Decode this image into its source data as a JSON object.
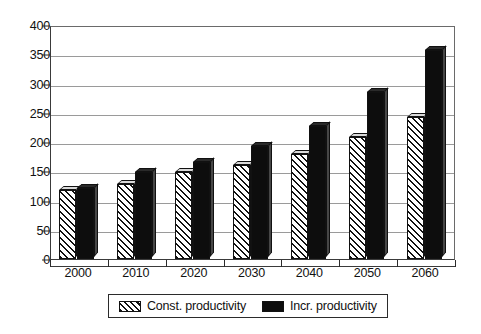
{
  "chart_data": {
    "type": "bar",
    "title": "",
    "subtitle": "",
    "xlabel": "",
    "ylabel": "",
    "categories": [
      "2000",
      "2010",
      "2020",
      "2030",
      "2040",
      "2050",
      "2060"
    ],
    "series": [
      {
        "name": "Const. productivity",
        "style": "hatched",
        "color": "#f2f2f2",
        "values": [
          118,
          128,
          148,
          161,
          180,
          208,
          243
        ]
      },
      {
        "name": "Incr. productivity",
        "style": "solid",
        "color": "#0d0d0d",
        "values": [
          122,
          148,
          166,
          193,
          228,
          285,
          357
        ]
      }
    ],
    "ylim": [
      0,
      400
    ],
    "ytick_labels": [
      "0",
      "50",
      "100",
      "150",
      "200",
      "250",
      "300",
      "350",
      "400"
    ],
    "ytick_values": [
      0,
      50,
      100,
      150,
      200,
      250,
      300,
      350,
      400
    ],
    "grid": true,
    "grid_axis": "y",
    "legend_position": "bottom",
    "legend_entries": [
      "Const. productivity",
      "Incr. productivity"
    ],
    "annotations": []
  },
  "legend": {
    "items": [
      {
        "label": "Const. productivity",
        "swatch": "hatched-swatch"
      },
      {
        "label": "Incr. productivity",
        "swatch": "solid-swatch"
      }
    ]
  },
  "colors": {
    "axis": "#2b2b2b",
    "grid": "#9a9a9a",
    "background": "#ffffff",
    "series_const": "#f2f2f2",
    "series_incr": "#0d0d0d"
  }
}
